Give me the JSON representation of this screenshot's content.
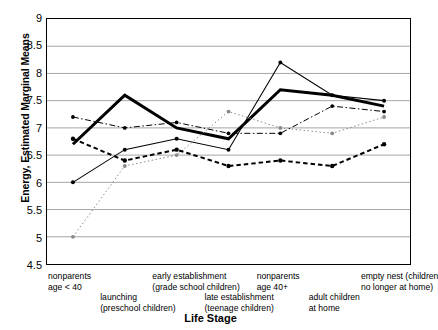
{
  "chart_data": {
    "type": "line",
    "title": "",
    "xlabel": "Life Stage",
    "ylabel": "Energy, Estimated Marginal Means",
    "ylim": [
      4.5,
      9.0
    ],
    "ytick_step": 0.5,
    "yticks": [
      "9",
      "8.5",
      "8",
      "7.5",
      "7",
      "6.5",
      "6",
      "5.5",
      "5",
      "4.5"
    ],
    "grid": "horizontal",
    "legend": "none",
    "categories": [
      "nonparents\nage < 40",
      "launching\n(preschool children)",
      "early establishment\n(grade school children)",
      "late establishment\n(teenage children)",
      "nonparents\nage 40+",
      "adult children\nat home",
      "empty nest (children\nno longer at home)"
    ],
    "category_lines": [
      [
        "nonparents",
        "age < 40"
      ],
      [
        "launching",
        "(preschool children)"
      ],
      [
        "early establishment",
        "(grade school children)"
      ],
      [
        "late establishment",
        "(teenage children)"
      ],
      [
        "nonparents",
        "age 40+"
      ],
      [
        "adult children",
        "at home"
      ],
      [
        "empty nest (children",
        "no longer at home)"
      ]
    ],
    "category_row": [
      0,
      1,
      0,
      1,
      0,
      1,
      0
    ],
    "series": [
      {
        "name": "series-thick-solid",
        "style": "thick-solid",
        "color": "#000000",
        "values": [
          6.7,
          7.6,
          7.0,
          6.8,
          7.7,
          7.6,
          7.4
        ]
      },
      {
        "name": "series-thin-solid",
        "style": "thin-solid",
        "color": "#000000",
        "values": [
          6.0,
          6.6,
          6.8,
          6.6,
          8.2,
          7.6,
          7.5
        ]
      },
      {
        "name": "series-dash-dot",
        "style": "dash-dot",
        "color": "#000000",
        "values": [
          7.2,
          7.0,
          7.1,
          6.9,
          6.9,
          7.4,
          7.3
        ]
      },
      {
        "name": "series-dotted",
        "style": "dotted",
        "color": "#888888",
        "values": [
          5.0,
          6.3,
          6.5,
          7.3,
          7.0,
          6.9,
          7.2
        ]
      },
      {
        "name": "series-dashed-bold",
        "style": "dashed-bold",
        "color": "#000000",
        "values": [
          6.8,
          6.4,
          6.6,
          6.3,
          6.4,
          6.3,
          6.7
        ]
      }
    ]
  }
}
